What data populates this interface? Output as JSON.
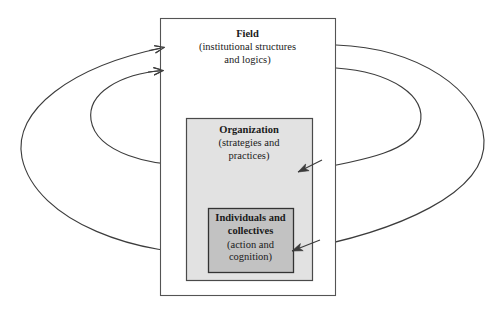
{
  "diagram": {
    "colors": {
      "stroke": "#3c3c3c",
      "field_fill": "#ffffff",
      "organization_fill": "#e2e2e2",
      "individuals_fill": "#c2c2c2",
      "text": "#1a1a1a"
    },
    "boxes": [
      {
        "id": "field",
        "name": "field-box",
        "title": "Field",
        "subtitle_line1": "(institutional structures",
        "subtitle_line2": "and logics)",
        "x": 160,
        "y": 18,
        "width": 175,
        "height": 277,
        "fill": "#ffffff"
      },
      {
        "id": "organization",
        "name": "organization-box",
        "title": "Organization",
        "subtitle_line1": "(strategies and",
        "subtitle_line2": "practices)",
        "x": 186,
        "y": 118,
        "width": 126,
        "height": 162,
        "fill": "#e2e2e2"
      },
      {
        "id": "individuals",
        "name": "individuals-box",
        "title_line1": "Individuals and",
        "title_line2": "collectives",
        "subtitle_line1": "(action and",
        "subtitle_line2": "cognition)",
        "x": 208,
        "y": 208,
        "width": 85,
        "height": 64,
        "fill": "#c2c2c2"
      }
    ],
    "arrows": [
      {
        "id": "org-to-field",
        "name": "arrow-organization-to-field",
        "from": "organization",
        "to": "field",
        "direction": "upward-outer-left-loop",
        "arrowhead_at": "field-left-edge-upper"
      },
      {
        "id": "ind-to-field",
        "name": "arrow-individuals-to-field",
        "from": "individuals",
        "to": "field",
        "direction": "upward-outer-left-loop",
        "arrowhead_at": "field-left-edge-lower"
      },
      {
        "id": "field-to-org",
        "name": "arrow-field-to-organization",
        "from": "field",
        "to": "organization",
        "direction": "downward-outer-right-loop",
        "arrowhead_at": "organization-right-interior"
      },
      {
        "id": "field-to-ind",
        "name": "arrow-field-to-individuals",
        "from": "field",
        "to": "individuals",
        "direction": "downward-outer-right-loop",
        "arrowhead_at": "individuals-right-interior"
      }
    ]
  }
}
